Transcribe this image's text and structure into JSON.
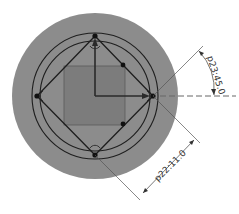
{
  "drawing": {
    "type": "sketch",
    "colors": {
      "background": "#ffffff",
      "outer_disc": "#8c8c8c",
      "square_fill": "#7c7c7c",
      "line": "#1e1e1e",
      "dimension_line": "#555555",
      "centerline": "#666666"
    },
    "center": [
      95,
      96
    ],
    "outer_disc_radius": 83,
    "circles": [
      63,
      55
    ],
    "diamond_vertices": [
      [
        95,
        36
      ],
      [
        153,
        96
      ],
      [
        95,
        155
      ],
      [
        37,
        96
      ]
    ],
    "square": {
      "x": 64,
      "y": 66,
      "w": 61,
      "h": 59
    },
    "points": [
      [
        95,
        36
      ],
      [
        153,
        96
      ],
      [
        95,
        155
      ],
      [
        37,
        96
      ],
      [
        123,
        65
      ],
      [
        123,
        124
      ]
    ]
  },
  "dimensions": {
    "angular": {
      "label": "p23:45.0"
    },
    "linear": {
      "label": "p22:11.0"
    }
  }
}
